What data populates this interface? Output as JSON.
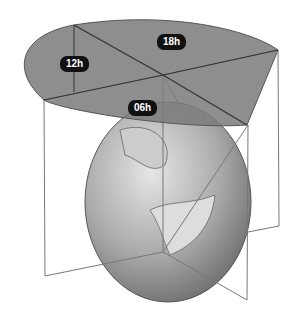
{
  "diagram": {
    "labels": [
      {
        "id": "12h",
        "text": "12h"
      },
      {
        "id": "18h",
        "text": "18h"
      },
      {
        "id": "06h",
        "text": "06h"
      }
    ]
  }
}
